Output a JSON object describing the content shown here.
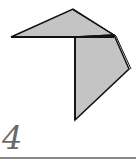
{
  "figure": {
    "label": "4",
    "fill_color": "#c4c4c4",
    "stroke_color": "#111111",
    "rule_color": "#8a8a8a",
    "label_color": "#6a6a6a"
  }
}
